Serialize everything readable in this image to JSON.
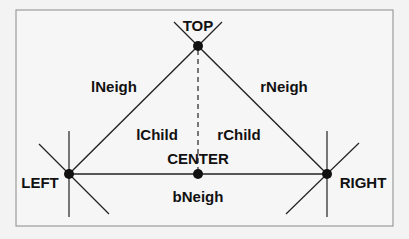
{
  "diagram": {
    "nodes": {
      "top": "TOP",
      "left": "LEFT",
      "right": "RIGHT",
      "center": "CENTER"
    },
    "edges": {
      "left_neighbor": "lNeigh",
      "right_neighbor": "rNeigh",
      "bottom_neighbor": "bNeigh",
      "left_child": "lChild",
      "right_child": "rChild"
    },
    "colors": {
      "background": "#f3f3f3",
      "frame": "#8a8a8a",
      "line": "#222222",
      "node": "#111111"
    }
  }
}
